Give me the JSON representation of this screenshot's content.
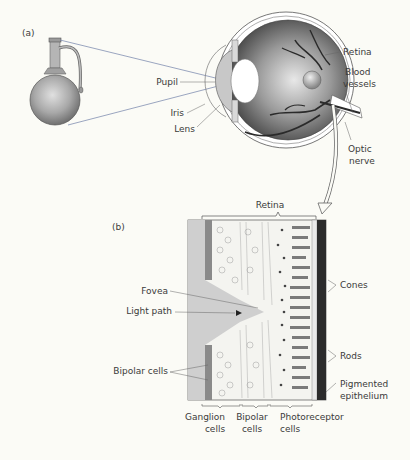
{
  "panel_a": {
    "label": "(a)",
    "labels": {
      "pupil": "Pupil",
      "iris": "Iris",
      "lens": "Lens",
      "retina": "Retina",
      "blood_vessels_1": "Blood",
      "blood_vessels_2": "vessels",
      "optic_nerve_1": "Optic",
      "optic_nerve_2": "nerve"
    },
    "object": "jug-icon"
  },
  "panel_b": {
    "label": "(b)",
    "retina_bracket": "Retina",
    "labels": {
      "fovea": "Fovea",
      "light_path": "Light path",
      "bipolar_cells": "Bipolar cells",
      "cones": "Cones",
      "rods": "Rods",
      "pigmented_1": "Pigmented",
      "pigmented_2": "epithelium"
    },
    "bottom_labels": [
      {
        "line1": "Ganglion",
        "line2": "cells"
      },
      {
        "line1": "Bipolar",
        "line2": "cells"
      },
      {
        "line1": "Photoreceptor",
        "line2": "cells"
      }
    ]
  },
  "colors": {
    "background": "#fbfbf6",
    "eye_gray": "#8d8d8d",
    "dark": "#2b2b2b",
    "accent_red": "#c4536a",
    "accent_blue": "#5b7fb0"
  }
}
